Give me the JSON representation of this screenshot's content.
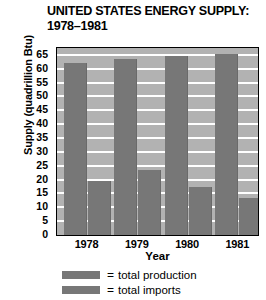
{
  "chart_data": {
    "type": "bar",
    "title": "UNITED STATES ENERGY SUPPLY: 1978–1981",
    "title_line1": "UNITED STATES ENERGY SUPPLY:",
    "title_line2": "1978–1981",
    "xlabel": "Year",
    "ylabel": "Supply (quadrillion Btu)",
    "categories": [
      "1978",
      "1979",
      "1980",
      "1981"
    ],
    "series": [
      {
        "name": "total production",
        "values": [
          62,
          63.5,
          64.5,
          65.5
        ]
      },
      {
        "name": "total imports",
        "values": [
          19.5,
          23.5,
          17.5,
          13.5
        ]
      }
    ],
    "ylim": [
      0,
      67.5
    ],
    "yticks": [
      0,
      5,
      10,
      15,
      20,
      25,
      30,
      35,
      40,
      45,
      50,
      55,
      60,
      65
    ],
    "ytick_labels": [
      "0",
      "5",
      "10",
      "15",
      "20",
      "25",
      "30",
      "35",
      "40",
      "45",
      "50",
      "55",
      "60",
      "65"
    ],
    "grid": true,
    "legend_position": "bottom",
    "legend": [
      {
        "marker": "=",
        "label": "total production"
      },
      {
        "marker": "=",
        "label": "total imports"
      }
    ],
    "colors": {
      "bar": "#777777",
      "plot_background": "#b2b2b2",
      "gridline": "#ffffff",
      "axis": "#000000",
      "text": "#000000"
    }
  }
}
